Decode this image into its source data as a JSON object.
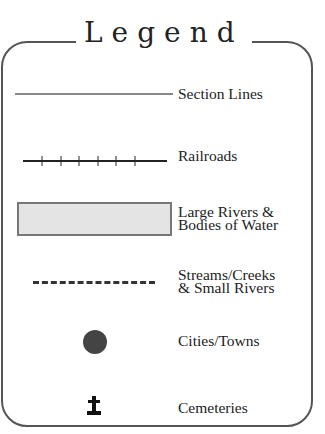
{
  "legend": {
    "title": "Legend",
    "items": [
      {
        "symbol": "solid-gray-line",
        "label": "Section Lines"
      },
      {
        "symbol": "railroad-line",
        "label": "Railroads"
      },
      {
        "symbol": "gray-filled-rectangle",
        "label_line1": "Large Rivers &",
        "label_line2": "Bodies of Water"
      },
      {
        "symbol": "dashed-line",
        "label_line1": "Streams/Creeks",
        "label_line2": "& Small Rivers"
      },
      {
        "symbol": "filled-circle",
        "label": "Cities/Towns"
      },
      {
        "symbol": "cross-icon",
        "label": "Cemeteries"
      }
    ]
  },
  "colors": {
    "border": "#555555",
    "section_line": "#888888",
    "water_fill": "#e4e4e4",
    "water_border": "#777777",
    "city_dot": "#444444",
    "text": "#222222"
  }
}
